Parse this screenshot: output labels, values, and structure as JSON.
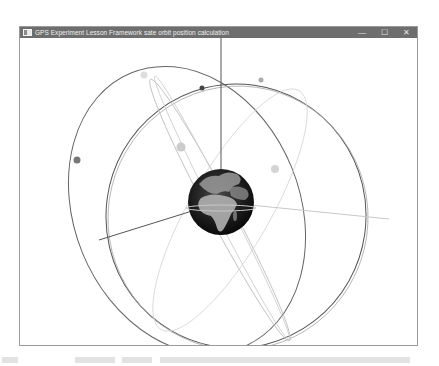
{
  "window": {
    "title": "GPS Experiment Lesson Framework sate orbit position calculation",
    "controls": {
      "minimize": "—",
      "maximize": "☐",
      "close": "✕"
    }
  },
  "scene": {
    "earth": {
      "cx": 201,
      "cy": 164,
      "r": 33
    },
    "axes": [
      {
        "name": "z-axis",
        "x1": 201,
        "y1": 0,
        "x2": 201,
        "y2": 131,
        "color": "#555555",
        "width": 1
      },
      {
        "name": "x-axis",
        "x1": 201,
        "y1": 164,
        "x2": 79,
        "y2": 202,
        "color": "#555555",
        "width": 1
      },
      {
        "name": "y-axis",
        "x1": 201,
        "y1": 164,
        "x2": 369,
        "y2": 181,
        "color": "#c8c8c8",
        "width": 1
      }
    ],
    "orbits": [
      {
        "cx": 167,
        "cy": 172,
        "rx": 113,
        "ry": 148,
        "rotate": -22,
        "color": "#666666",
        "width": 1
      },
      {
        "cx": 216,
        "cy": 178,
        "rx": 130,
        "ry": 132,
        "rotate": 8,
        "color": "#555555",
        "width": 1
      },
      {
        "cx": 218,
        "cy": 180,
        "rx": 130,
        "ry": 132,
        "rotate": 8,
        "color": "#aaaaaa",
        "width": 0.8
      },
      {
        "cx": 200,
        "cy": 172,
        "rx": 148,
        "ry": 12,
        "rotate": 62,
        "color": "#bbbbbb",
        "width": 0.8
      },
      {
        "cx": 202,
        "cy": 170,
        "rx": 148,
        "ry": 8,
        "rotate": 63,
        "color": "#cccccc",
        "width": 0.8
      },
      {
        "cx": 210,
        "cy": 172,
        "rx": 138,
        "ry": 40,
        "rotate": -60,
        "color": "#d6d6d6",
        "width": 0.8
      }
    ],
    "satellites": [
      {
        "id": "sat-1",
        "cx": 57,
        "cy": 122,
        "r": 3.5,
        "color": "#777777"
      },
      {
        "id": "sat-2",
        "cx": 182,
        "cy": 50,
        "r": 2.5,
        "color": "#444444"
      },
      {
        "id": "sat-3",
        "cx": 241,
        "cy": 42,
        "r": 2.5,
        "color": "#aaaaaa"
      },
      {
        "id": "sat-4",
        "cx": 124,
        "cy": 37,
        "r": 3.5,
        "color": "#dddddd"
      },
      {
        "id": "sat-5",
        "cx": 161,
        "cy": 109,
        "r": 4.5,
        "color": "#cccccc"
      },
      {
        "id": "sat-6",
        "cx": 255,
        "cy": 131,
        "r": 4,
        "color": "#d4d4d4"
      }
    ]
  },
  "caption": {
    "text": "图 9-17  轨道与卫星位置计算 GPS卫星 实验框架的运行效果图与计算卫星位置的结果"
  }
}
